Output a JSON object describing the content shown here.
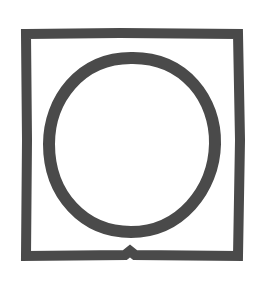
{
  "symbol": {
    "name": "tumble-dry-symbol",
    "stroke_color": "#4a4a4a",
    "background": "#ffffff"
  }
}
